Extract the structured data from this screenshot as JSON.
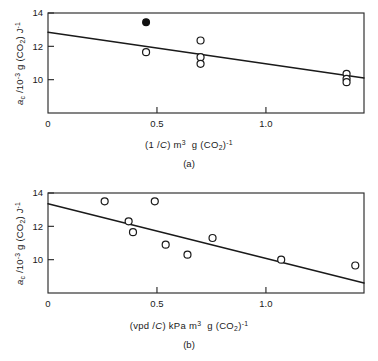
{
  "figure": {
    "panels": [
      {
        "id": "a",
        "caption": "(a)",
        "xlabel_html": "(1 /<span class=\"it\">C</span>) m<sup>3</sup>&nbsp; g (CO<sub>2</sub>)<sup>-1</sup>",
        "ylabel_html": "<span class=\"it\">a</span><sub>c</sub> /10<sup>-3</sup> g (CO<sub>2</sub>) J<sup>-1</sup>",
        "xticks": [
          "0",
          "0.5",
          "1.0"
        ],
        "yticks": [
          "10",
          "12",
          "14"
        ]
      },
      {
        "id": "b",
        "caption": "(b)",
        "xlabel_html": "(vpd /<span class=\"it\">C</span>) kPa m<sup>3</sup>&nbsp; g (CO<sub>2</sub>)<sup>-1</sup>",
        "ylabel_html": "<span class=\"it\">a</span><sub>c</sub> /10<sup>-3</sup> g (CO<sub>2</sub>) J<sup>-1</sup>",
        "xticks": [
          "0",
          "0.5",
          "1.0"
        ],
        "yticks": [
          "10",
          "12",
          "14"
        ]
      }
    ]
  },
  "chart_data": [
    {
      "type": "scatter",
      "panel": "a",
      "title": "",
      "xlabel": "(1/C) m^3 g (CO2)^-1",
      "ylabel": "a_c /10^-3 g (CO2) J^-1",
      "xlim": [
        0,
        1.45
      ],
      "ylim": [
        8,
        14
      ],
      "xticks": [
        0,
        0.5,
        1.0
      ],
      "yticks": [
        10,
        12,
        14
      ],
      "grid": false,
      "legend": "none",
      "series": [
        {
          "name": "open circles",
          "marker": "open-circle",
          "points": [
            {
              "x": 0.45,
              "y": 11.65
            },
            {
              "x": 0.7,
              "y": 12.35
            },
            {
              "x": 0.7,
              "y": 11.35
            },
            {
              "x": 0.7,
              "y": 10.95
            },
            {
              "x": 1.37,
              "y": 10.35
            },
            {
              "x": 1.37,
              "y": 10.05
            },
            {
              "x": 1.37,
              "y": 9.85
            }
          ]
        },
        {
          "name": "filled circle",
          "marker": "filled-circle",
          "points": [
            {
              "x": 0.45,
              "y": 13.45
            }
          ]
        }
      ],
      "fit_line": {
        "x": [
          0,
          1.45
        ],
        "y": [
          12.85,
          10.1
        ]
      }
    },
    {
      "type": "scatter",
      "panel": "b",
      "title": "",
      "xlabel": "(vpd/C) kPa m^3 g (CO2)^-1",
      "ylabel": "a_c /10^-3 g (CO2) J^-1",
      "xlim": [
        0,
        1.45
      ],
      "ylim": [
        8,
        14
      ],
      "xticks": [
        0,
        0.5,
        1.0
      ],
      "yticks": [
        10,
        12,
        14
      ],
      "grid": false,
      "legend": "none",
      "series": [
        {
          "name": "open circles",
          "marker": "open-circle",
          "points": [
            {
              "x": 0.26,
              "y": 13.5
            },
            {
              "x": 0.37,
              "y": 12.3
            },
            {
              "x": 0.39,
              "y": 11.65
            },
            {
              "x": 0.49,
              "y": 13.5
            },
            {
              "x": 0.54,
              "y": 10.9
            },
            {
              "x": 0.64,
              "y": 10.3
            },
            {
              "x": 0.755,
              "y": 11.3
            },
            {
              "x": 1.07,
              "y": 10.0
            },
            {
              "x": 1.41,
              "y": 9.65
            }
          ]
        }
      ],
      "fit_line": {
        "x": [
          0,
          1.45
        ],
        "y": [
          13.35,
          8.6
        ]
      }
    }
  ]
}
